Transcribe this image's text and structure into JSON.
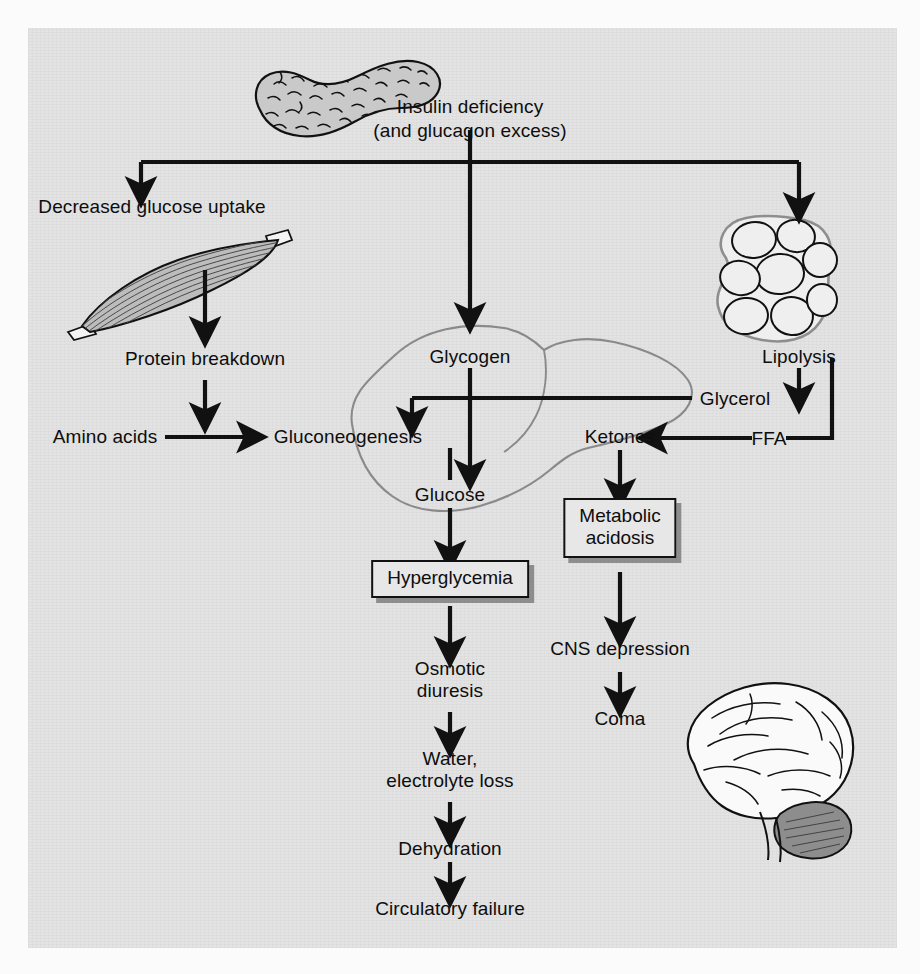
{
  "figure": {
    "title_line1": "Insulin deficiency",
    "title_line2": "(and glucagon excess)",
    "background_color": "#e3e3e3",
    "ink_color": "#0d0d0d"
  },
  "illustrations": [
    {
      "name": "pancreas",
      "label": "pancreas-illustration"
    },
    {
      "name": "skeletal-muscle",
      "label": "skeletal-muscle-illustration"
    },
    {
      "name": "adipocytes",
      "label": "adipose-tissue-illustration"
    },
    {
      "name": "liver",
      "label": "liver-outline-illustration"
    },
    {
      "name": "brain",
      "label": "brain-illustration"
    }
  ],
  "nodes": {
    "decreased_glucose_uptake": "Decreased glucose uptake",
    "protein_breakdown": "Protein breakdown",
    "amino_acids": "Amino acids",
    "gluconeogenesis": "Gluconeogenesis",
    "glycogen": "Glycogen",
    "glucose": "Glucose",
    "ketones": "Ketones",
    "lipolysis": "Lipolysis",
    "glycerol": "Glycerol",
    "ffa": "FFA",
    "hyperglycemia": "Hyperglycemia",
    "metabolic_acidosis": "Metabolic\nacidosis",
    "osmotic_diuresis": "Osmotic\ndiuresis",
    "cns_depression": "CNS depression",
    "coma": "Coma",
    "water_electrolyte_loss": "Water,\nelectrolyte loss",
    "dehydration": "Dehydration",
    "circulatory_failure": "Circulatory failure"
  },
  "boxed_nodes": [
    "hyperglycemia",
    "metabolic_acidosis"
  ],
  "flow_edges": [
    {
      "from": "insulin-deficiency",
      "to": "decreased-glucose-uptake"
    },
    {
      "from": "insulin-deficiency",
      "to": "glycogen"
    },
    {
      "from": "insulin-deficiency",
      "to": "adipose-tissue"
    },
    {
      "from": "skeletal-muscle",
      "to": "protein-breakdown"
    },
    {
      "from": "protein-breakdown",
      "to": "amino-acids"
    },
    {
      "from": "amino-acids",
      "to": "gluconeogenesis"
    },
    {
      "from": "glycerol",
      "to": "gluconeogenesis"
    },
    {
      "from": "glycogen",
      "to": "glucose"
    },
    {
      "from": "gluconeogenesis",
      "to": "glucose"
    },
    {
      "from": "glucose",
      "to": "hyperglycemia"
    },
    {
      "from": "lipolysis",
      "to": "glycerol"
    },
    {
      "from": "lipolysis",
      "to": "ffa"
    },
    {
      "from": "ffa",
      "to": "ketones"
    },
    {
      "from": "ketones",
      "to": "metabolic-acidosis"
    },
    {
      "from": "hyperglycemia",
      "to": "osmotic-diuresis"
    },
    {
      "from": "osmotic-diuresis",
      "to": "water-electrolyte-loss"
    },
    {
      "from": "water-electrolyte-loss",
      "to": "dehydration"
    },
    {
      "from": "dehydration",
      "to": "circulatory-failure"
    },
    {
      "from": "metabolic-acidosis",
      "to": "cns-depression"
    },
    {
      "from": "cns-depression",
      "to": "coma"
    }
  ]
}
